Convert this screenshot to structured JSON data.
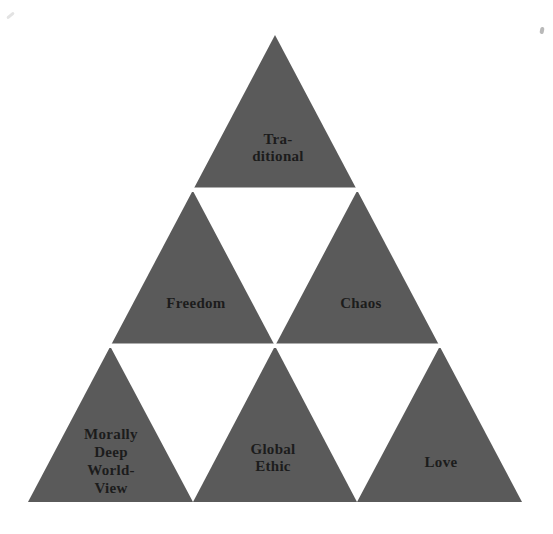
{
  "diagram": {
    "type": "triangle-of-triangles",
    "colors": {
      "triangle": "#5a5a5a",
      "gap": "#ffffff",
      "background": "#ffffff",
      "text": "#1c1c1c"
    },
    "labels": {
      "top": "Tra-\nditional",
      "middle_left": "Freedom",
      "middle_right": "Chaos",
      "bottom_left": "Morally\nDeep\nWorld-\nView",
      "bottom_center": "Global\nEthic",
      "bottom_right": "Love"
    }
  }
}
